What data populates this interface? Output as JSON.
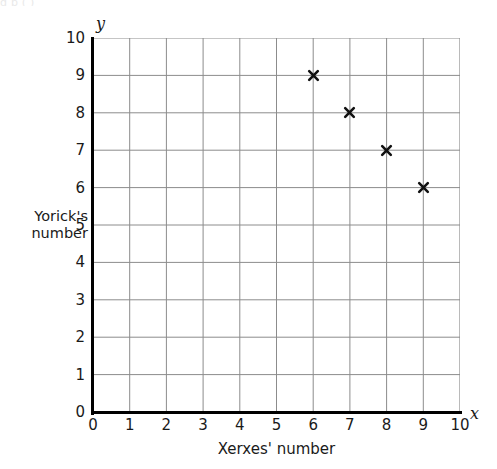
{
  "page": {
    "header_remnant": "g                p                                        ( )"
  },
  "chart_data": {
    "type": "scatter",
    "title": "",
    "xlabel": "Xerxes' number",
    "ylabel": "Yorick's number",
    "ylabel_lines": [
      "Yorick's",
      "number"
    ],
    "x_var_symbol": "x",
    "y_var_symbol": "y",
    "xlim": [
      0,
      10
    ],
    "ylim": [
      0,
      10
    ],
    "x_ticks": [
      0,
      1,
      2,
      3,
      4,
      5,
      6,
      7,
      8,
      9,
      10
    ],
    "y_ticks": [
      0,
      1,
      2,
      3,
      4,
      5,
      6,
      7,
      8,
      9,
      10
    ],
    "grid": true,
    "grid_color": "#8c8c8c",
    "axis_color": "#000000",
    "marker_color": "#111111",
    "marker_style": "x",
    "legend": null,
    "points": [
      {
        "x": 6,
        "y": 9
      },
      {
        "x": 7,
        "y": 8
      },
      {
        "x": 8,
        "y": 7
      },
      {
        "x": 9,
        "y": 6
      }
    ]
  }
}
